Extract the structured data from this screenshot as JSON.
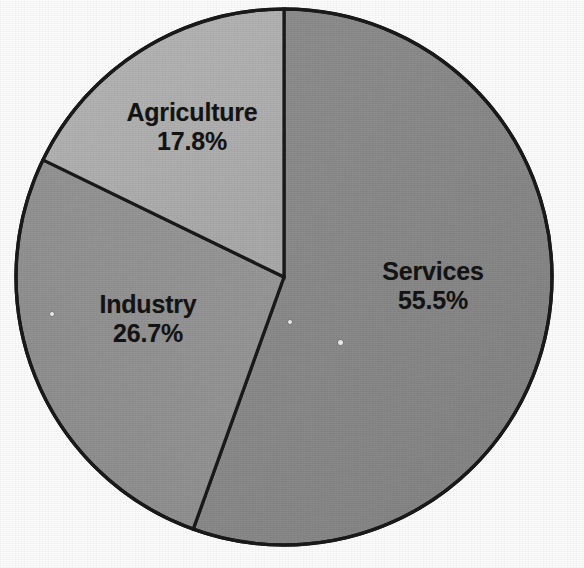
{
  "chart_data": {
    "type": "pie",
    "title": "",
    "subtitle": "",
    "xlabel": "",
    "ylabel": "",
    "grid": false,
    "legend_position": "none",
    "labels_inside_slices": true,
    "start_angle_deg": 0,
    "direction": "clockwise",
    "units": "percent",
    "total": 100,
    "categories": [
      "Services",
      "Industry",
      "Agriculture"
    ],
    "values": [
      55.5,
      26.7,
      17.8
    ],
    "slices": [
      {
        "name": "Services",
        "value": 55.5,
        "value_label": "55.5%",
        "color": "#8a8a8a",
        "start_angle_deg": 0,
        "end_angle_deg": 199.8
      },
      {
        "name": "Industry",
        "value": 26.7,
        "value_label": "26.7%",
        "color": "#939393",
        "start_angle_deg": 199.8,
        "end_angle_deg": 295.92
      },
      {
        "name": "Agriculture",
        "value": 17.8,
        "value_label": "17.8%",
        "color": "#b0b0b0",
        "start_angle_deg": 295.92,
        "end_angle_deg": 360
      }
    ]
  },
  "labels": {
    "agriculture": {
      "name": "Agriculture",
      "value": "17.8%"
    },
    "services": {
      "name": "Services",
      "value": "55.5%"
    },
    "industry": {
      "name": "Industry",
      "value": "26.7%"
    }
  },
  "style": {
    "background": "#fdfdfd",
    "outline": "#1a1a1a",
    "text": "#141414",
    "slice_services": "#8a8a8a",
    "slice_industry": "#939393",
    "slice_agriculture": "#b0b0b0"
  }
}
